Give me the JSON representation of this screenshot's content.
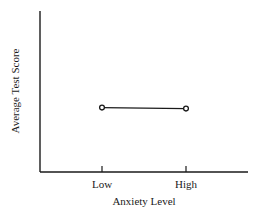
{
  "chart_data": {
    "type": "line",
    "title": "",
    "xlabel": "Anxiety Level",
    "ylabel": "Average Test Score",
    "categories": [
      "Low",
      "High"
    ],
    "series": [
      {
        "name": "Average Test Score",
        "values": [
          0.4,
          0.4
        ],
        "marker": "open-circle"
      }
    ],
    "ylim": [
      0,
      1
    ],
    "y_units": "relative (no numeric scale shown)",
    "grid": false,
    "legend": "none"
  },
  "colors": {
    "ink": "#1a1a1a",
    "background": "#ffffff"
  }
}
